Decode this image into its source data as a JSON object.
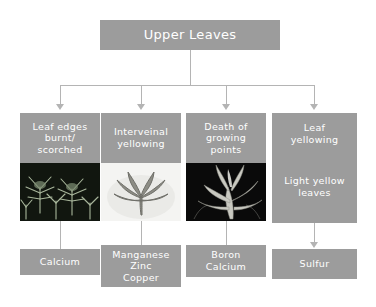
{
  "diagram": {
    "title": "Upper Leaves",
    "type": "flowchart",
    "orientation": "top-down",
    "colors": {
      "box_fill": "#9c9c9c",
      "box_text": "#ffffff",
      "connector": "#b4b4b4",
      "background": "#ffffff"
    },
    "root": {
      "label": "Upper Leaves"
    },
    "branches": [
      {
        "symptom": "Leaf edges\nburnt/\nscorched",
        "symptom_lines": [
          "Leaf edges",
          "burnt/",
          "scorched"
        ],
        "photo": "cannabis-plant-photo",
        "photo_alt": "dark photo of cannabis plant tops with scorched leaf edges",
        "nutrients": [
          "Calcium"
        ],
        "connector_to_nutrient": "line"
      },
      {
        "symptom": "Interveinal\nyellowing",
        "symptom_lines": [
          "Interveinal",
          "yellowing"
        ],
        "photo": "cannabis-leaf-photo",
        "photo_alt": "single cannabis leaf on white background showing interveinal yellowing",
        "nutrients": [
          "Manganese",
          "Zinc",
          "Copper"
        ],
        "connector_to_nutrient": "line"
      },
      {
        "symptom": "Death of\ngrowing\npoints",
        "symptom_lines": [
          "Death of",
          "growing",
          "points"
        ],
        "photo": "cannabis-growing-tip-photo",
        "photo_alt": "dark photo of cannabis growing tip with dying new growth",
        "nutrients": [
          "Boron",
          "Calcium"
        ],
        "connector_to_nutrient": "line"
      },
      {
        "symptom": "Leaf\nyellowing",
        "symptom_lines": [
          "Leaf",
          "yellowing"
        ],
        "sub_symptom_lines": [
          "Light yellow",
          "leaves"
        ],
        "photo": null,
        "nutrients": [
          "Sulfur"
        ],
        "connector_to_nutrient": "arrow"
      }
    ]
  }
}
